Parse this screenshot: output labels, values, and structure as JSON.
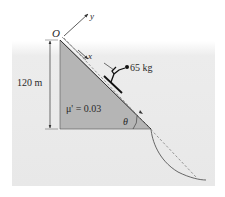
{
  "diagram": {
    "labels": {
      "origin": "O",
      "x_axis": "x",
      "y_axis": "y",
      "mass": "65 kg",
      "height": "120 m",
      "friction": "μ' = 0.03",
      "angle": "θ"
    },
    "colors": {
      "panel": "#ececec",
      "triangle": "#b5b5b5",
      "line": "#333333",
      "dashed": "#8a8a8a"
    }
  }
}
